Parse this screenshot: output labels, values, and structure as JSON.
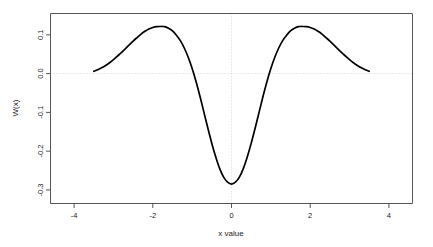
{
  "chart_data": {
    "type": "line",
    "title": "",
    "subtitle": "",
    "xlabel": "x value",
    "ylabel": "W(x)",
    "xlim": [
      -4.6,
      4.6
    ],
    "ylim": [
      -0.335,
      0.155
    ],
    "grid": true,
    "grid_style": "dotted",
    "grid_lines": {
      "horizontal_at_y": 0.0,
      "vertical_at_x": 0.0
    },
    "legend": null,
    "legend_position": "none",
    "xticks": [
      -4,
      -2,
      0,
      2,
      4
    ],
    "xtick_labels": [
      "-4",
      "-2",
      "0",
      "2",
      "4"
    ],
    "yticks": [
      0.1,
      0.0,
      -0.1,
      -0.2,
      -0.3
    ],
    "ytick_labels": [
      "0.1",
      "0.0",
      "-0.1",
      "-0.2",
      "-0.3"
    ],
    "ytick_label_rotation": 90,
    "line_color": "#000000",
    "line_width": 1.7,
    "series": [
      {
        "name": "W(x)",
        "x": [
          -3.5,
          -3.4,
          -3.3,
          -3.2,
          -3.1,
          -3.0,
          -2.9,
          -2.8,
          -2.7,
          -2.6,
          -2.5,
          -2.4,
          -2.3,
          -2.2,
          -2.1,
          -2.0,
          -1.9,
          -1.8,
          -1.75,
          -1.7,
          -1.6,
          -1.5,
          -1.4,
          -1.3,
          -1.2,
          -1.1,
          -1.0,
          -0.9,
          -0.8,
          -0.7,
          -0.6,
          -0.5,
          -0.4,
          -0.3,
          -0.2,
          -0.1,
          0.0,
          0.1,
          0.2,
          0.3,
          0.4,
          0.5,
          0.6,
          0.7,
          0.8,
          0.9,
          1.0,
          1.1,
          1.2,
          1.3,
          1.4,
          1.5,
          1.6,
          1.7,
          1.75,
          1.8,
          1.9,
          2.0,
          2.1,
          2.2,
          2.3,
          2.4,
          2.5,
          2.6,
          2.7,
          2.8,
          2.9,
          3.0,
          3.1,
          3.2,
          3.3,
          3.4,
          3.5
        ],
        "y": [
          0.006,
          0.01,
          0.015,
          0.021,
          0.028,
          0.036,
          0.045,
          0.054,
          0.064,
          0.074,
          0.084,
          0.093,
          0.102,
          0.109,
          0.115,
          0.119,
          0.121,
          0.1215,
          0.1215,
          0.121,
          0.117,
          0.11,
          0.099,
          0.085,
          0.066,
          0.042,
          0.013,
          -0.021,
          -0.059,
          -0.1,
          -0.141,
          -0.18,
          -0.215,
          -0.245,
          -0.267,
          -0.28,
          -0.285,
          -0.28,
          -0.267,
          -0.245,
          -0.215,
          -0.18,
          -0.141,
          -0.1,
          -0.059,
          -0.021,
          0.013,
          0.042,
          0.066,
          0.085,
          0.099,
          0.11,
          0.117,
          0.121,
          0.1215,
          0.1215,
          0.121,
          0.119,
          0.115,
          0.109,
          0.102,
          0.093,
          0.084,
          0.074,
          0.064,
          0.054,
          0.045,
          0.036,
          0.028,
          0.021,
          0.015,
          0.01,
          0.006
        ]
      }
    ],
    "annotations": {
      "minimum": {
        "x": 0.0,
        "y": -0.285
      },
      "left_peak": {
        "x": -1.75,
        "y": 0.1215
      },
      "right_peak": {
        "x": 1.75,
        "y": 0.1215
      },
      "zero_crossings": [
        -1.0,
        1.0
      ],
      "data_x_range": [
        -3.5,
        3.5
      ]
    }
  }
}
